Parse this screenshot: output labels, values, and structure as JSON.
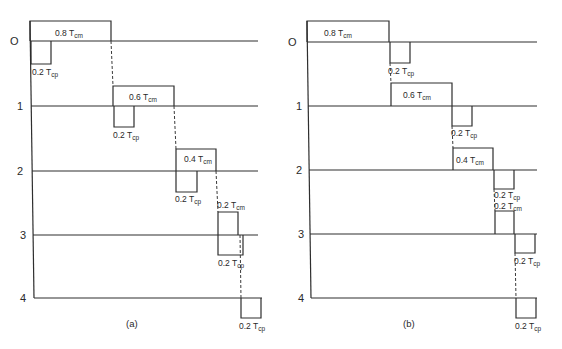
{
  "figure": {
    "panels": [
      {
        "id": "a",
        "caption": "(a)",
        "levels": [
          "O",
          "1",
          "2",
          "3",
          "4"
        ],
        "blocks": [
          {
            "label": "0.8 T",
            "sub": "cm",
            "kind": "compute"
          },
          {
            "label": "0.2 T",
            "sub": "cp",
            "kind": "communicate"
          },
          {
            "label": "0.6 T",
            "sub": "cm",
            "kind": "compute"
          },
          {
            "label": "0.2 T",
            "sub": "cp",
            "kind": "communicate"
          },
          {
            "label": "0.4 T",
            "sub": "cm",
            "kind": "compute"
          },
          {
            "label": "0.2 T",
            "sub": "cp",
            "kind": "communicate"
          },
          {
            "label": "0.2 T",
            "sub": "cm",
            "kind": "compute"
          },
          {
            "label": "0.2 T",
            "sub": "cp",
            "kind": "communicate"
          },
          {
            "label": "0.2 T",
            "sub": "cp",
            "kind": "communicate"
          }
        ]
      },
      {
        "id": "b",
        "caption": "(b)",
        "levels": [
          "O",
          "1",
          "2",
          "3",
          "4"
        ],
        "blocks": [
          {
            "label": "0.8 T",
            "sub": "cm",
            "kind": "compute"
          },
          {
            "label": "0.2 T",
            "sub": "cp",
            "kind": "communicate"
          },
          {
            "label": "0.6 T",
            "sub": "cm",
            "kind": "compute"
          },
          {
            "label": "0.2 T",
            "sub": "cp",
            "kind": "communicate"
          },
          {
            "label": "0.4 T",
            "sub": "cm",
            "kind": "compute"
          },
          {
            "label": "0.2 T",
            "sub": "cp",
            "kind": "communicate"
          },
          {
            "label": "0.2 T",
            "sub": "cm",
            "kind": "compute"
          },
          {
            "label": "0.2 T",
            "sub": "cp",
            "kind": "communicate"
          },
          {
            "label": "0.2 T",
            "sub": "cp",
            "kind": "communicate"
          }
        ]
      }
    ]
  }
}
